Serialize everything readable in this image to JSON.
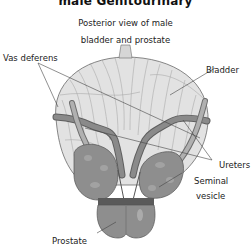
{
  "figure": {
    "title": "male Genitourinary",
    "subtitle_line1": "Posterior view of male",
    "subtitle_line2": "bladder and prostate"
  },
  "labels": {
    "bladder": "Bladder",
    "vas_deferens": "Vas deferens",
    "ureters": "Ureters",
    "seminal_vesicle_line1": "Seminal",
    "seminal_vesicle_line2": "vesicle",
    "prostate": "Prostate"
  },
  "colors": {
    "background": "#ffffff",
    "bladder_fill": "#e2e2e2",
    "bladder_stroke": "#6a6a6a",
    "organ_fill": "#8e8e8e",
    "organ_dark": "#5a5a5a",
    "duct_fill": "#7d7d7d",
    "leader_line": "#444444"
  }
}
